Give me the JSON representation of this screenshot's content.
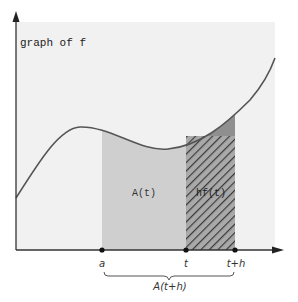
{
  "diagram": {
    "title": "graph of f",
    "colors": {
      "background": "#f1f1f1",
      "region_a_to_t": "#cfcfcf",
      "region_t_to_th_top": "#8f8f8f",
      "hatch_fill": "#a9a9a9",
      "hatch_lines": "#3a3a3a",
      "curve": "#555555",
      "axis": "#333333"
    },
    "regions": {
      "area_label": "A(t)",
      "strip_label": "hf(t)"
    },
    "x_axis_points": [
      {
        "id": "a",
        "label": "a"
      },
      {
        "id": "t",
        "label": "t"
      },
      {
        "id": "t_plus_h",
        "label": "t+h"
      }
    ],
    "brace_label": "A(t+h)"
  }
}
